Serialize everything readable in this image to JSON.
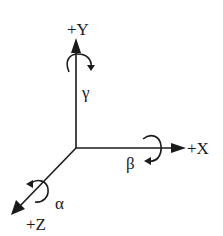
{
  "diagram": {
    "type": "3d-coordinate-axes-with-rotations",
    "origin": {
      "x": 76,
      "y": 148
    },
    "axes": [
      {
        "id": "y",
        "label": "+Y",
        "rotation_symbol": "γ",
        "rotation_name": "gamma",
        "direction": "up"
      },
      {
        "id": "x",
        "label": "+X",
        "rotation_symbol": "β",
        "rotation_name": "beta",
        "direction": "right"
      },
      {
        "id": "z",
        "label": "+Z",
        "rotation_symbol": "α",
        "rotation_name": "alpha",
        "direction": "down-left"
      }
    ],
    "colors": {
      "stroke": "#1a1a1a",
      "background": "#ffffff"
    }
  }
}
